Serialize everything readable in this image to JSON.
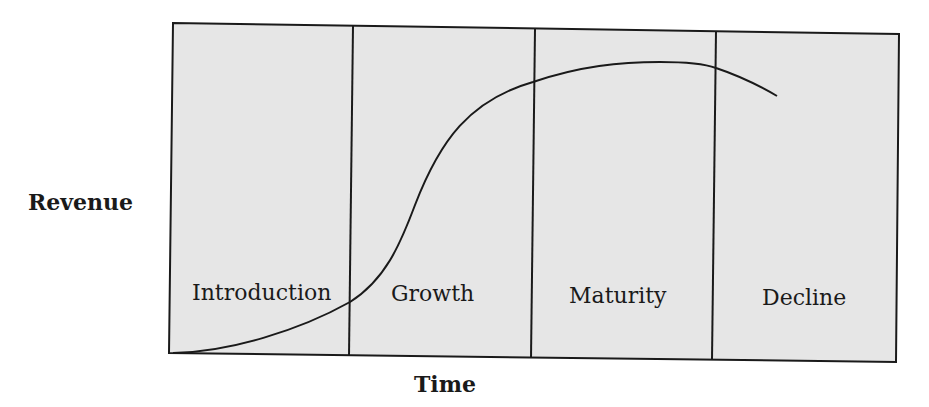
{
  "diagram": {
    "y_axis_label": "Revenue",
    "x_axis_label": "Time",
    "colors": {
      "panel_fill": "#e6e6e6",
      "stroke": "#1a1a1a",
      "background": "#ffffff"
    },
    "stages": [
      {
        "label": "Introduction"
      },
      {
        "label": "Growth"
      },
      {
        "label": "Maturity"
      },
      {
        "label": "Decline"
      }
    ],
    "curve": {
      "description": "S-shaped revenue curve rising slowly in Introduction, steeply in Growth, peaking in Maturity, and falling in Decline"
    }
  }
}
